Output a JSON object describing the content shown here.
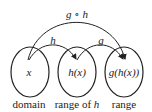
{
  "diagram": {
    "sets": [
      {
        "id": "domain",
        "element_label": "x",
        "caption": "domain"
      },
      {
        "id": "range_h",
        "element_label": "h(x)",
        "caption_prefix": "range of ",
        "caption_var": "h"
      },
      {
        "id": "range",
        "element_label": "g(h(x))",
        "caption": "range"
      }
    ],
    "arrows": [
      {
        "from": "x",
        "to": "h(x)",
        "label": "h"
      },
      {
        "from": "h(x)",
        "to": "g(h(x))",
        "label": "g"
      },
      {
        "from": "x",
        "to": "g(h(x))",
        "label": "g ∘ h"
      }
    ],
    "colors": {
      "stroke": "#222222",
      "background": "#ffffff"
    }
  }
}
